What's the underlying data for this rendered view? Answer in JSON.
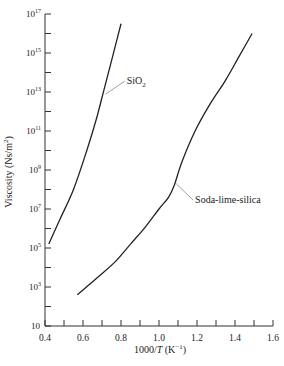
{
  "chart_data": {
    "type": "line",
    "title": "",
    "xlabel": "1000/T (K⁻¹)",
    "xlabel_parts": {
      "pre": "1000/",
      "var": "T",
      "post": " (K",
      "sup": "−1",
      "close": ")"
    },
    "ylabel": "Viscosity (Ns/m²)",
    "ylabel_parts": {
      "pre": "Viscosity (Ns/m",
      "sup": "2",
      "close": ")"
    },
    "xlim": [
      0.4,
      1.6
    ],
    "ylim_log10": [
      1,
      17
    ],
    "y_scale": "log",
    "grid": false,
    "legend": "none (inline leader labels)",
    "x_ticks": [
      0.4,
      0.6,
      0.8,
      1.0,
      1.2,
      1.4,
      1.6
    ],
    "x_tick_labels": [
      "0.4",
      "0.6",
      "0.8",
      "1.0",
      "1.2",
      "1.4",
      "1.6"
    ],
    "x_minor_ticks": [
      0.5,
      0.7,
      0.9,
      1.1,
      1.3,
      1.5
    ],
    "y_ticks_log10": [
      1,
      3,
      5,
      7,
      9,
      11,
      13,
      15,
      17
    ],
    "y_tick_labels": [
      {
        "base": "10",
        "exp": ""
      },
      {
        "base": "10",
        "exp": "3"
      },
      {
        "base": "10",
        "exp": "5"
      },
      {
        "base": "10",
        "exp": "7"
      },
      {
        "base": "10",
        "exp": "9"
      },
      {
        "base": "10",
        "exp": "11"
      },
      {
        "base": "10",
        "exp": "13"
      },
      {
        "base": "10",
        "exp": "15"
      },
      {
        "base": "10",
        "exp": "17"
      }
    ],
    "y_minor_ticks_log10": [
      2,
      4,
      6,
      8,
      10,
      12,
      14,
      16
    ],
    "series": [
      {
        "name": "SiO₂",
        "label_parts": {
          "pre": "SiO",
          "sub": "2"
        },
        "x": [
          0.42,
          0.48,
          0.55,
          0.62,
          0.67,
          0.71,
          0.75,
          0.8
        ],
        "log10_y": [
          5.2,
          6.5,
          8.0,
          10.0,
          11.6,
          13.1,
          14.6,
          16.5
        ],
        "label_anchor": {
          "x": 0.715,
          "log10_y": 12.9
        },
        "label_pos": {
          "x": 0.83,
          "log10_y": 13.4
        }
      },
      {
        "name": "Soda-lime-silica",
        "label_parts": {
          "pre": "Soda-lime-silica",
          "sub": ""
        },
        "x": [
          0.57,
          0.63,
          0.69,
          0.77,
          0.85,
          0.93,
          1.0,
          1.05,
          1.08,
          1.12,
          1.19,
          1.27,
          1.35,
          1.42,
          1.49
        ],
        "log10_y": [
          2.6,
          3.1,
          3.6,
          4.3,
          5.2,
          6.1,
          7.0,
          7.6,
          8.2,
          9.4,
          11.0,
          12.4,
          13.6,
          14.8,
          16.0
        ],
        "label_anchor": {
          "x": 1.085,
          "log10_y": 8.3
        },
        "label_pos": {
          "x": 1.19,
          "log10_y": 7.3
        }
      }
    ]
  }
}
